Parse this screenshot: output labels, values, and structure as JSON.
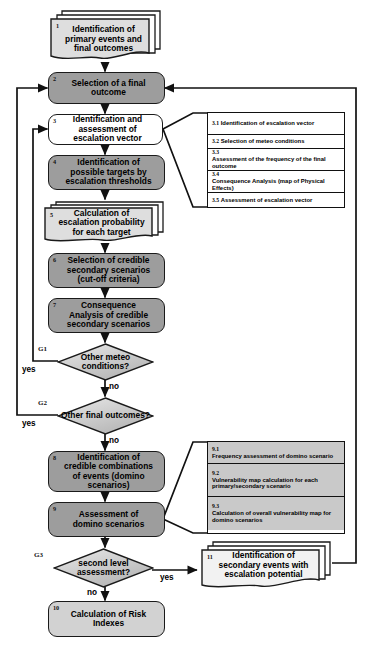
{
  "diagram": {
    "colors": {
      "dark_fill": "#9d9d9d",
      "light_fill": "#d2d2d2",
      "panel_grey_fill": "#c9c9c9",
      "panel_white_fill": "#ffffff",
      "stroke": "#1a1a1a",
      "background": "#ffffff"
    }
  },
  "nodes": {
    "n1": {
      "id": "1",
      "label": "Identification of primary events and final outcomes",
      "shape": "stacked-document",
      "fill": "light"
    },
    "n2": {
      "id": "2",
      "label": "Selection of a final outcome",
      "shape": "process",
      "fill": "dark"
    },
    "n3": {
      "id": "3",
      "label": "Identification and assessment of escalation vector",
      "shape": "process",
      "fill": "white"
    },
    "n4": {
      "id": "4",
      "label": "Identification of possible targets by escalation thresholds",
      "shape": "process",
      "fill": "dark"
    },
    "n5": {
      "id": "5",
      "label": "Calculation of escalation probability for each target",
      "shape": "stacked-document",
      "fill": "light"
    },
    "n6": {
      "id": "6",
      "label": "Selection of credible secondary scenarios (cut-off criteria)",
      "shape": "process",
      "fill": "dark"
    },
    "n7": {
      "id": "7",
      "label": "Consequence Analysis of credible secondary scenarios",
      "shape": "process",
      "fill": "dark"
    },
    "n8": {
      "id": "8",
      "label": "Identification of credible combinations of events (domino scenarios)",
      "shape": "process",
      "fill": "dark"
    },
    "n9": {
      "id": "9",
      "label": "Assessment of domino scenarios",
      "shape": "process",
      "fill": "dark"
    },
    "n10": {
      "id": "10",
      "label": "Calculation of Risk Indexes",
      "shape": "process",
      "fill": "light"
    },
    "n11": {
      "id": "11",
      "label": "Identification of secondary events with escalation potential",
      "shape": "stacked-document",
      "fill": "white"
    }
  },
  "gates": {
    "g1": {
      "tag": "G1",
      "label": "Other meteo conditions?",
      "yes": "yes",
      "no": "no"
    },
    "g2": {
      "tag": "G2",
      "label": "Other final outcomes?",
      "yes": "yes",
      "no": "no"
    },
    "g3": {
      "tag": "G3",
      "label": "second level assessment?",
      "yes": "yes",
      "no": "no"
    }
  },
  "panel_3": {
    "rows": [
      {
        "key": "3.1",
        "label": "Identification of escalation vector"
      },
      {
        "key": "3.2",
        "label": "Selection of meteo conditions"
      },
      {
        "key": "3.3",
        "label": "Assessment of the frequency of the final outcome"
      },
      {
        "key": "3.4",
        "label": "Consequence Analysis (map of Physical Effects)"
      },
      {
        "key": "3.5",
        "label": "Assessment of escalation vector"
      }
    ]
  },
  "panel_9": {
    "rows": [
      {
        "key": "9.1",
        "label": "Frequency assessment of domino scenario"
      },
      {
        "key": "9.2",
        "label": "Vulnerability map calculation for each primary/secondary scenario"
      },
      {
        "key": "9.3",
        "label": "Calculation of overall vulnerability map for domino scenarios"
      }
    ]
  }
}
